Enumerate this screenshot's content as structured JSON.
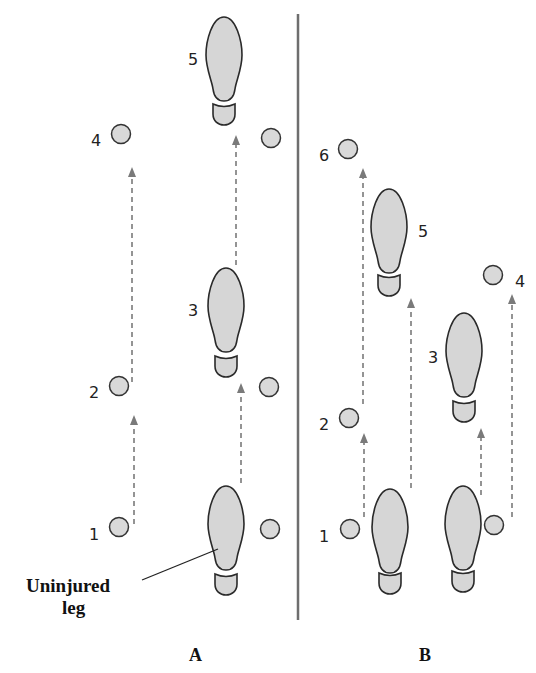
{
  "figure": {
    "panels": [
      {
        "label": "A",
        "steps": [
          {
            "num": "1",
            "kind": "crutches"
          },
          {
            "num": "2",
            "kind": "crutches"
          },
          {
            "num": "3",
            "kind": "foot"
          },
          {
            "num": "4",
            "kind": "crutches"
          },
          {
            "num": "5",
            "kind": "foot"
          }
        ],
        "callout": {
          "line1": "Uninjured",
          "line2": "leg"
        }
      },
      {
        "label": "B",
        "steps": [
          {
            "num": "1",
            "kind": "crutch"
          },
          {
            "num": "2",
            "kind": "crutch"
          },
          {
            "num": "3",
            "kind": "foot"
          },
          {
            "num": "4",
            "kind": "crutch"
          },
          {
            "num": "5",
            "kind": "foot"
          },
          {
            "num": "6",
            "kind": "crutch"
          }
        ]
      }
    ],
    "colors": {
      "foot_fill": "#d6d6d6",
      "outline": "#2a2a2a",
      "arrow": "#7a7a7a",
      "divider": "#6e6e6e"
    }
  }
}
